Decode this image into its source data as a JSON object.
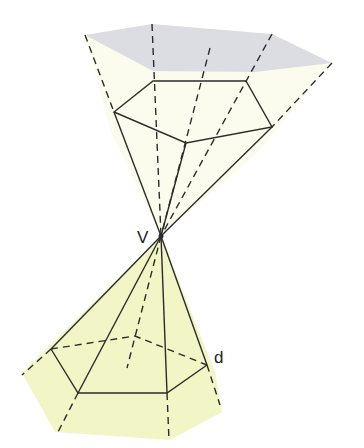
{
  "diagram": {
    "type": "double pyramid cone through vertex",
    "labels": {
      "vertex": "V",
      "edge": "d"
    },
    "colors": {
      "upper_cap": "#dcdde3",
      "upper_fill": "#fbfcee",
      "lower_fill": "#f2f6c6",
      "stroke": "#2b2b2b"
    }
  }
}
